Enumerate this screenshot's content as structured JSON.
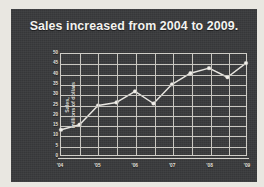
{
  "slide": {
    "title": "Sales increased from 2004 to 2009.",
    "panel_color": "#393a3c",
    "frame_color": "#e9e7e1",
    "text_color": "#f4f3f0",
    "grid_color": "#c9c7c1",
    "line_color": "#e8e6e1"
  },
  "chart_data": {
    "type": "line",
    "title": "Sales increased from 2004 to 2009.",
    "xlabel": "",
    "ylabel": "Sales,\nmillions of dollars",
    "ylim": [
      0,
      50
    ],
    "yticks": [
      50,
      45,
      40,
      35,
      30,
      25,
      20,
      15,
      10,
      5,
      0
    ],
    "xticks": [
      "'04",
      "'05",
      "'06",
      "'07",
      "'08",
      "'09"
    ],
    "grid": true,
    "legend": false,
    "markers": true,
    "x": [
      0,
      1,
      2,
      3,
      4,
      5,
      6,
      7,
      8,
      9,
      10
    ],
    "values": [
      12.5,
      15,
      24.5,
      26,
      31.5,
      25.5,
      35,
      40.5,
      43,
      38.5,
      45.5
    ],
    "series": [
      {
        "name": "Sales",
        "values": [
          12.5,
          15,
          24.5,
          26,
          31.5,
          25.5,
          35,
          40.5,
          43,
          38.5,
          45.5
        ]
      }
    ]
  }
}
